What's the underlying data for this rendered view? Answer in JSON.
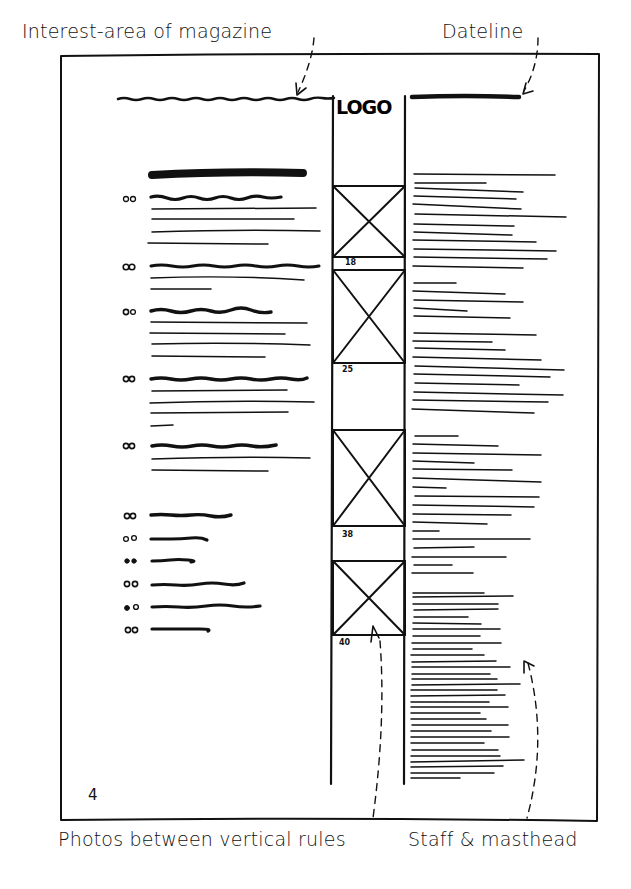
{
  "annotations": {
    "interest_area": "Interest-area of magazine",
    "dateline": "Dateline",
    "photos": "Photos between vertical rules",
    "staff": "Staff & masthead"
  },
  "page": {
    "logo": "LOGO",
    "folio": "4"
  },
  "photo_column": {
    "photos": [
      {
        "page_ref": "18"
      },
      {
        "page_ref": "25"
      },
      {
        "page_ref": "38"
      },
      {
        "page_ref": "40"
      }
    ]
  },
  "contents_column": {
    "entries": [
      {
        "marker": "00",
        "head_width": 135,
        "lines": [
          165,
          140,
          170,
          120
        ]
      },
      {
        "marker": "00",
        "head_width": 168,
        "lines": [
          155,
          60
        ]
      },
      {
        "marker": "00",
        "head_width": 122,
        "lines": [
          157,
          137,
          160,
          115
        ]
      },
      {
        "marker": "00",
        "head_width": 157,
        "lines": [
          137,
          165,
          138,
          23
        ]
      },
      {
        "marker": "00",
        "head_width": 125,
        "lines": [
          160,
          118
        ]
      },
      {
        "marker": "00",
        "head_width": 82,
        "lines": []
      },
      {
        "marker": "00",
        "head_width": 57,
        "lines": []
      },
      {
        "marker": "00",
        "head_width": 40,
        "lines": []
      },
      {
        "marker": "00",
        "head_width": 95,
        "lines": []
      },
      {
        "marker": "00",
        "head_width": 110,
        "lines": []
      },
      {
        "marker": "00",
        "head_width": 58,
        "lines": []
      }
    ]
  },
  "colors": {
    "ink": "#111111",
    "paper": "#ffffff"
  }
}
